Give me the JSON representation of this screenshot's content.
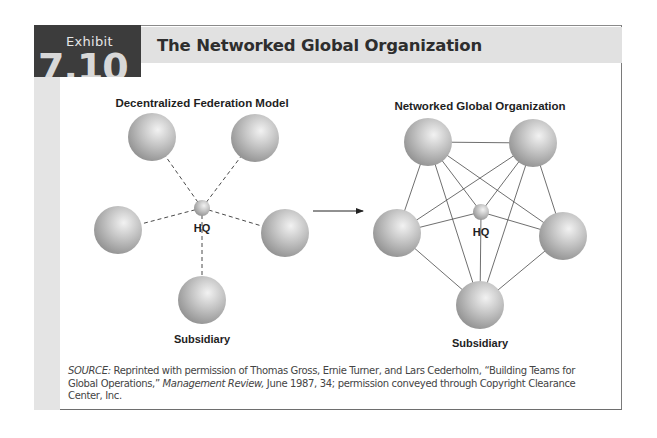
{
  "exhibit": {
    "label": "Exhibit",
    "number": "7.10",
    "title": "The Networked Global Organization"
  },
  "left_diagram": {
    "title": "Decentralized Federation Model",
    "hub_label": "HQ",
    "node_label": "Subsidiary",
    "link_style": "dashed",
    "hub": {
      "x": 202,
      "y": 208,
      "r": 8
    },
    "nodes": [
      {
        "id": "top-left",
        "x": 152,
        "y": 137,
        "r": 24
      },
      {
        "id": "top-right",
        "x": 255,
        "y": 138,
        "r": 24
      },
      {
        "id": "left",
        "x": 118,
        "y": 230,
        "r": 24
      },
      {
        "id": "right",
        "x": 285,
        "y": 233,
        "r": 24
      },
      {
        "id": "bottom",
        "x": 202,
        "y": 300,
        "r": 24
      }
    ],
    "links": [
      [
        "hub",
        "top-left"
      ],
      [
        "hub",
        "top-right"
      ],
      [
        "hub",
        "left"
      ],
      [
        "hub",
        "right"
      ],
      [
        "hub",
        "bottom"
      ]
    ]
  },
  "arrow": {
    "x1": 313,
    "y1": 211,
    "x2": 363,
    "y2": 211
  },
  "right_diagram": {
    "title": "Networked Global Organization",
    "hub_label": "HQ",
    "node_label": "Subsidiary",
    "link_style": "solid",
    "hub": {
      "x": 481,
      "y": 212,
      "r": 8
    },
    "nodes": [
      {
        "id": "top-left",
        "x": 428,
        "y": 142,
        "r": 24
      },
      {
        "id": "top-right",
        "x": 533,
        "y": 143,
        "r": 24
      },
      {
        "id": "left",
        "x": 397,
        "y": 233,
        "r": 24
      },
      {
        "id": "right",
        "x": 563,
        "y": 236,
        "r": 24
      },
      {
        "id": "bottom",
        "x": 480,
        "y": 305,
        "r": 24
      }
    ],
    "links": [
      [
        "top-left",
        "top-right"
      ],
      [
        "top-left",
        "left"
      ],
      [
        "top-right",
        "right"
      ],
      [
        "left",
        "bottom"
      ],
      [
        "right",
        "bottom"
      ],
      [
        "top-left",
        "right"
      ],
      [
        "top-left",
        "bottom"
      ],
      [
        "top-right",
        "left"
      ],
      [
        "top-right",
        "bottom"
      ],
      [
        "hub",
        "top-left"
      ],
      [
        "hub",
        "top-right"
      ],
      [
        "hub",
        "left"
      ],
      [
        "hub",
        "right"
      ],
      [
        "hub",
        "bottom"
      ]
    ]
  },
  "source": {
    "prefix": "SOURCE:",
    "text_1": " Reprinted with permission of Thomas Gross, Ernie Turner, and Lars Cederholm, “Building Teams for Global Operations,” ",
    "journal": "Management Review,",
    "text_2": " June 1987, 34; permission conveyed through Copyright Clearance Center, Inc."
  },
  "colors": {
    "exhibit_block": "#3c3c3c",
    "title_band": "#e1e1e1",
    "left_strip": "#e4e4e4",
    "sphere_light": "#ededed",
    "sphere_dark": "#8c8c8c",
    "line": "#4a4a4a"
  }
}
